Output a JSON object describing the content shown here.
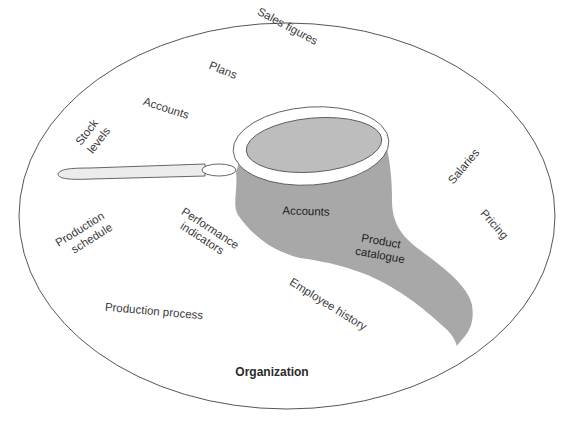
{
  "diagram": {
    "title": "Organization",
    "colors": {
      "background": "#ffffff",
      "outline": "#555555",
      "net_fill": "#a8a8a8",
      "net_opening": "#bdbdbd",
      "hoop": "#ffffff",
      "handle": "#ececec",
      "text": "#3a3a3a"
    },
    "outer_labels": [
      {
        "id": "sales-figures",
        "text": "Sales figures"
      },
      {
        "id": "plans",
        "text": "Plans"
      },
      {
        "id": "accounts-outer",
        "text": "Accounts"
      },
      {
        "id": "stock-levels-1",
        "text": "Stock"
      },
      {
        "id": "stock-levels-2",
        "text": "levels"
      },
      {
        "id": "salaries",
        "text": "Salaries"
      },
      {
        "id": "pricing",
        "text": "Pricing"
      },
      {
        "id": "production-schedule-1",
        "text": "Production"
      },
      {
        "id": "production-schedule-2",
        "text": "schedule"
      },
      {
        "id": "performance-indicators-1",
        "text": "Performance"
      },
      {
        "id": "performance-indicators-2",
        "text": "indicators"
      },
      {
        "id": "employee-history",
        "text": "Employee history"
      },
      {
        "id": "production-process",
        "text": "Production process"
      }
    ],
    "net_labels": [
      {
        "id": "accounts-in-net",
        "text": "Accounts"
      },
      {
        "id": "product-catalogue-1",
        "text": "Product"
      },
      {
        "id": "product-catalogue-2",
        "text": "catalogue"
      }
    ],
    "icons": {
      "net": "butterfly-net-icon",
      "boundary": "organization-ellipse"
    }
  }
}
